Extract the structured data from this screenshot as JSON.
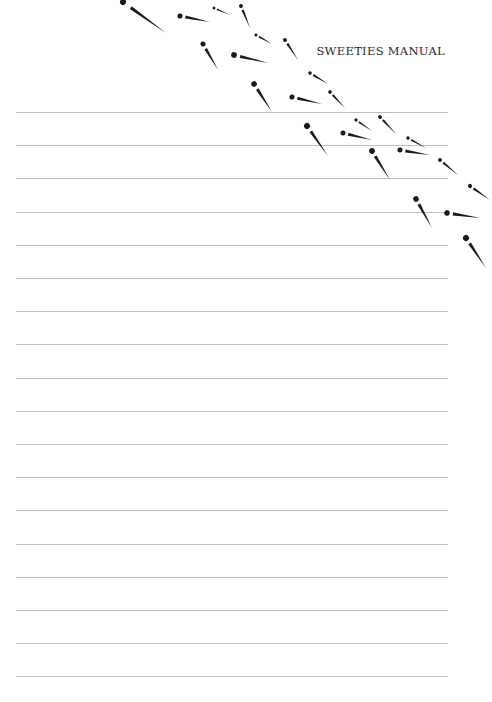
{
  "header": {
    "title": "SWEETIES MANUAL"
  },
  "page": {
    "background": "#ffffff",
    "rule_color": "#bdbdbd",
    "rule_count": 18,
    "rule_start_y": 112,
    "rule_spacing": 33.2,
    "rule_left": 16,
    "rule_right": 448
  },
  "decoration": {
    "icon": "ink-dash-marks-icon",
    "color": "#1a1a1a",
    "marks": [
      [
        123,
        2,
        166,
        33
      ],
      [
        180,
        16,
        210,
        22
      ],
      [
        214,
        8,
        230,
        15
      ],
      [
        241,
        6,
        250,
        28
      ],
      [
        203,
        44,
        218,
        70
      ],
      [
        234,
        55,
        268,
        63
      ],
      [
        256,
        35,
        272,
        44
      ],
      [
        285,
        40,
        298,
        60
      ],
      [
        254,
        84,
        272,
        112
      ],
      [
        292,
        97,
        322,
        104
      ],
      [
        310,
        73,
        328,
        84
      ],
      [
        330,
        92,
        345,
        108
      ],
      [
        307,
        126,
        328,
        156
      ],
      [
        343,
        133,
        372,
        140
      ],
      [
        356,
        120,
        372,
        131
      ],
      [
        380,
        117,
        396,
        134
      ],
      [
        372,
        151,
        390,
        180
      ],
      [
        400,
        150,
        430,
        155
      ],
      [
        408,
        138,
        426,
        148
      ],
      [
        440,
        160,
        458,
        175
      ],
      [
        416,
        199,
        432,
        228
      ],
      [
        447,
        213,
        480,
        218
      ],
      [
        470,
        186,
        490,
        200
      ],
      [
        466,
        238,
        486,
        268
      ]
    ]
  }
}
